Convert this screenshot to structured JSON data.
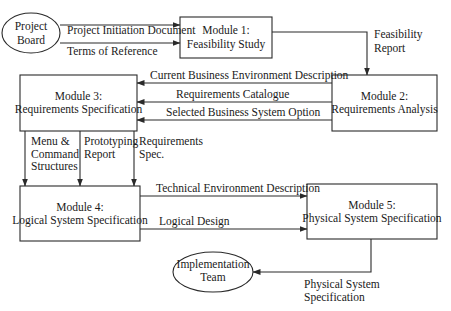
{
  "nodes": {
    "project_board": {
      "lines": [
        "Project",
        "Board"
      ],
      "shape": "ellipse"
    },
    "module1": {
      "lines": [
        "Module 1:",
        "Feasibility Study"
      ],
      "shape": "box"
    },
    "module2": {
      "lines": [
        "Module 2:",
        "Requirements Analysis"
      ],
      "shape": "box"
    },
    "module3": {
      "lines": [
        "Module 3:",
        "Requirements Specification"
      ],
      "shape": "box"
    },
    "module4": {
      "lines": [
        "Module 4:",
        "Logical System Specification"
      ],
      "shape": "box"
    },
    "module5": {
      "lines": [
        "Module 5:",
        "Physical System Specification"
      ],
      "shape": "box"
    },
    "implementation_team": {
      "lines": [
        "Implementation",
        "Team"
      ],
      "shape": "ellipse"
    }
  },
  "edges": {
    "pid": {
      "from": "Project Board",
      "to": "Module 1",
      "label": [
        "Project Initiation Document"
      ]
    },
    "tor": {
      "from": "Project Board",
      "to": "Module 1",
      "label": [
        "Terms of Reference"
      ]
    },
    "feasibility": {
      "from": "Module 1",
      "to": "Module 2",
      "label": [
        "Feasibility",
        "Report"
      ]
    },
    "cbed": {
      "from": "Module 2",
      "to": "Module 3",
      "label": [
        "Current Business Environment Description"
      ]
    },
    "req_cat": {
      "from": "Module 2",
      "to": "Module 3",
      "label": [
        "Requirements Catalogue"
      ]
    },
    "sbso": {
      "from": "Module 2",
      "to": "Module 3",
      "label": [
        "Selected Business System Option"
      ]
    },
    "menu": {
      "from": "Module 3",
      "to": "Module 4",
      "label": [
        "Menu &",
        "Command",
        "Structures"
      ]
    },
    "proto": {
      "from": "Module 3",
      "to": "Module 4",
      "label": [
        "Prototyping",
        "Report"
      ]
    },
    "reqspec": {
      "from": "Module 3",
      "to": "Module 4",
      "label": [
        "Requirements",
        "Spec."
      ]
    },
    "ted": {
      "from": "Module 4",
      "to": "Module 5",
      "label": [
        "Technical Environment Description"
      ]
    },
    "logical": {
      "from": "Module 4",
      "to": "Module 5",
      "label": [
        "Logical Design"
      ]
    },
    "physical": {
      "from": "Module 5",
      "to": "Implementation Team",
      "label": [
        "Physical System",
        "Specification"
      ]
    }
  },
  "colors": {
    "stroke": "#2a2a2a",
    "text": "#1a1a1a",
    "background": "#ffffff"
  }
}
